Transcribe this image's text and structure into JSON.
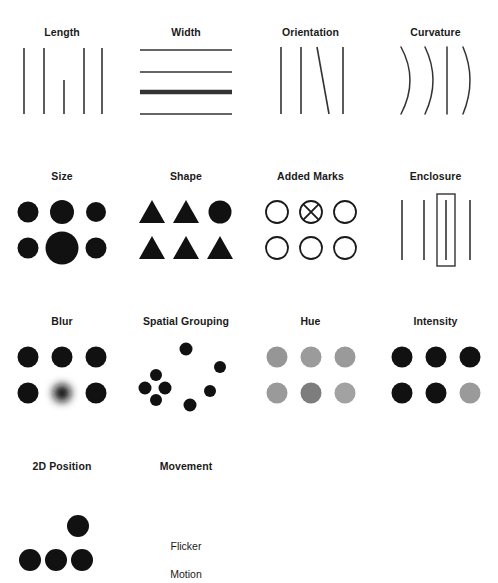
{
  "figure": {
    "artifact_text": "",
    "background_color": "#ffffff",
    "ink_color": "#1a1a1a",
    "stroke_color": "#333333",
    "gray_color": "#8c8c8c",
    "columns": 4,
    "rows": 4
  },
  "cells": [
    {
      "id": "length",
      "label": "Length",
      "kind": "lines-vertical",
      "description": "Five vertical lines; the middle line is shorter than the others."
    },
    {
      "id": "width",
      "label": "Width",
      "kind": "lines-horizontal",
      "description": "Four horizontal lines; the third line is much thicker."
    },
    {
      "id": "orientation",
      "label": "Orientation",
      "kind": "lines-orientation",
      "description": "Four vertical lines; the third line is tilted."
    },
    {
      "id": "curvature",
      "label": "Curvature",
      "kind": "arcs",
      "description": "Four curved arcs; the third is straight."
    },
    {
      "id": "size",
      "label": "Size",
      "kind": "dot-grid-size",
      "description": "Six filled dots in a 3x2 grid; the bottom-middle dot is much larger."
    },
    {
      "id": "shape",
      "label": "Shape",
      "kind": "shape-grid",
      "description": "Six marks in a 3x2 grid; five triangles and one circle at top right."
    },
    {
      "id": "added-marks",
      "label": "Added Marks",
      "kind": "circle-grid-marks",
      "description": "Six hollow circles in a 3x2 grid; the top-middle circle contains an X."
    },
    {
      "id": "enclosure",
      "label": "Enclosure",
      "kind": "lines-enclosure",
      "description": "Four vertical lines; the third is surrounded by a rectangle."
    },
    {
      "id": "blur",
      "label": "Blur",
      "kind": "dot-grid-blur",
      "description": "Six filled dots in a 3x2 grid; the bottom-middle dot is blurred."
    },
    {
      "id": "spatial-grouping",
      "label": "Spatial Grouping",
      "kind": "scatter-grouping",
      "description": "Eight dots; four are tightly clustered at the left, four are scattered."
    },
    {
      "id": "hue",
      "label": "Hue",
      "kind": "dot-grid-hue",
      "description": "Six gray dots in a 3x2 grid; the bottom-middle dot differs in hue."
    },
    {
      "id": "intensity",
      "label": "Intensity",
      "kind": "dot-grid-intensity",
      "description": "Six dots in a 3x2 grid; five are black and the bottom-right is gray."
    },
    {
      "id": "2d-position",
      "label": "2D Position",
      "kind": "position-dots",
      "description": "Four filled dots; three in a row and the fourth raised above."
    },
    {
      "id": "movement",
      "label": "Movement",
      "kind": "movement-text",
      "description": "Text-only cell listing movement sub-channels.",
      "sub_labels": [
        "Flicker",
        "Motion"
      ]
    }
  ],
  "colors": {
    "dot_fill": "#111111",
    "hue_dot_a": "#969696",
    "hue_dot_b": "#7d7d7d",
    "intensity_gray": "#9a9a9a",
    "line_stroke": "#333333"
  }
}
